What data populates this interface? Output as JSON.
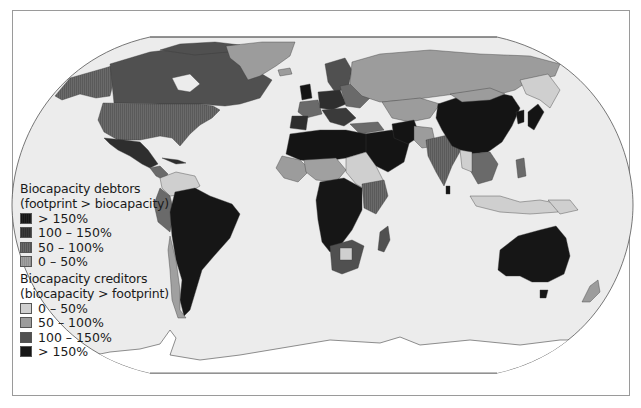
{
  "map": {
    "type": "choropleth",
    "projection": "Robinson-like (flat-polar pseudocylindrical)",
    "ocean_color": "#ececec",
    "frame_color": "#9a9a9a"
  },
  "legend": {
    "debtors": {
      "title_line1": "Biocapacity debtors",
      "title_line2": "(footprint > biocapacity)",
      "items": [
        {
          "label": "> 150%",
          "color": "#141414",
          "pattern": "vertical-hatch"
        },
        {
          "label": "100 – 150%",
          "color": "#2e2e2e",
          "pattern": "vertical-hatch"
        },
        {
          "label": "50 – 100%",
          "color": "#6a6a6a",
          "pattern": "vertical-hatch"
        },
        {
          "label": "0 – 50%",
          "color": "#a0a0a0",
          "pattern": "vertical-hatch"
        }
      ]
    },
    "creditors": {
      "title_line1": "Biocapacity creditors",
      "title_line2": "(biocapacity > footprint)",
      "items": [
        {
          "label": "0 – 50%",
          "color": "#cfcfcf",
          "pattern": "solid"
        },
        {
          "label": "50 – 100%",
          "color": "#9c9c9c",
          "pattern": "solid"
        },
        {
          "label": "100 – 150%",
          "color": "#505050",
          "pattern": "solid"
        },
        {
          "label": "> 150%",
          "color": "#161616",
          "pattern": "solid"
        }
      ]
    }
  },
  "regions": {
    "canada": "creditor 100-150%",
    "usa": "debtor 50-100%",
    "alaska": "debtor 50-100%",
    "greenland": "creditor 50-100%",
    "mexico": "debtor 100-150%",
    "central_america": "mixed",
    "brazil_south_america": "creditor >150%",
    "colombia_venezuela": "creditor 50-100%",
    "peru": "creditor 100-150%",
    "chile": "debtor 0-50%",
    "western_europe": "debtor 100-150% / >150%",
    "scandinavia": "creditor 100-150%",
    "russia": "creditor 50-100%",
    "kazakhstan_central_asia": "creditor 50-100%",
    "north_africa": "debtor >150%",
    "sahel": "creditor 50-100%",
    "central_africa": "creditor >150%",
    "east_africa": "debtor 50-100%",
    "southern_africa": "mixed",
    "madagascar": "creditor 100-150%",
    "middle_east": "debtor >150%",
    "india": "debtor 50-100%",
    "china": "debtor >150%",
    "mongolia": "creditor 50-100%",
    "japan_korea": "debtor >150%",
    "southeast_asia": "mixed",
    "indonesia": "creditor 0-50%",
    "australia": "creditor >150%",
    "new_zealand": "creditor 50-100%",
    "antarctica": "no data"
  }
}
